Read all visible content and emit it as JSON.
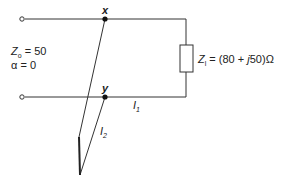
{
  "diagram": {
    "type": "transmission-line stub matching circuit",
    "nodes": {
      "x_label": "x",
      "y_label": "y"
    },
    "line_params": {
      "z0_symbol": "Z",
      "z0_sub": "o",
      "z0_value": " = 50",
      "alpha_text": "α = 0"
    },
    "load": {
      "symbol": "Z",
      "sub": "l",
      "value": " = (80 + ",
      "j": "j",
      "value_end": "50)Ω"
    },
    "currents": {
      "i1_symbol": "I",
      "i1_sub": "1",
      "i2_symbol": "I",
      "i2_sub": "2"
    },
    "colors": {
      "line": "#333333",
      "text": "#222222"
    }
  }
}
